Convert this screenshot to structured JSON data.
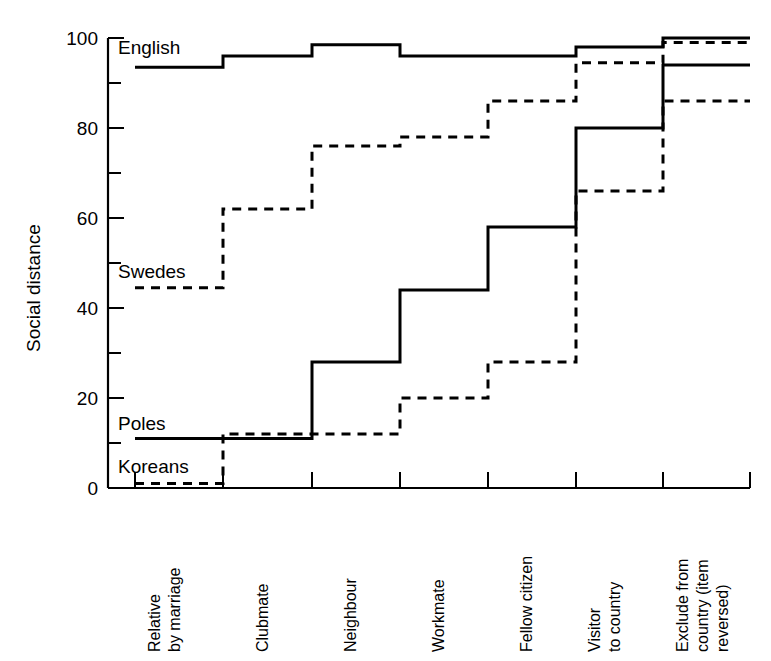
{
  "chart_data": {
    "type": "line",
    "title": "",
    "xlabel": "",
    "ylabel": "Social distance",
    "ylim": [
      0,
      100
    ],
    "yticks": [
      0,
      20,
      40,
      60,
      80,
      100
    ],
    "yticks_minor": [
      10,
      30,
      50,
      70,
      90
    ],
    "ytick_labels": [
      "0",
      "20",
      "40",
      "60",
      "80",
      "100"
    ],
    "grid": false,
    "legend_position": "inline-left",
    "step_style": "post",
    "categories": [
      "Relative by marriage",
      "Clubmate",
      "Neighbour",
      "Workmate",
      "Fellow citizen",
      "Visitor to country",
      "Exclude from country (item reversed)"
    ],
    "category_lines": [
      [
        "Relative",
        "by marriage"
      ],
      [
        "Clubmate"
      ],
      [
        "Neighbour"
      ],
      [
        "Workmate"
      ],
      [
        "Fellow citizen"
      ],
      [
        "Visitor",
        "to country"
      ],
      [
        "Exclude from",
        "country (item",
        "reversed)"
      ]
    ],
    "series": [
      {
        "name": "English",
        "style": "solid",
        "values": [
          93.5,
          96,
          98.5,
          96,
          96,
          98,
          100
        ]
      },
      {
        "name": "Swedes",
        "style": "dashed",
        "values": [
          44.5,
          62,
          76,
          78,
          86,
          94.5,
          99
        ]
      },
      {
        "name": "Poles",
        "style": "solid",
        "values": [
          11,
          11,
          28,
          44,
          58,
          80,
          94
        ]
      },
      {
        "name": "Koreans",
        "style": "dashed",
        "values": [
          1,
          12,
          12,
          20,
          28,
          66,
          86
        ]
      }
    ]
  },
  "axes": {
    "y_axis_title": "Social distance"
  },
  "series_labels": {
    "english": "English",
    "swedes": "Swedes",
    "poles": "Poles",
    "koreans": "Koreans"
  },
  "ytick_text": {
    "t100": "100",
    "t80": "80",
    "t60": "60",
    "t40": "40",
    "t20": "20",
    "t0": "0"
  },
  "xcat_text": {
    "c0l0": "Relative",
    "c0l1": "by marriage",
    "c1l0": "Clubmate",
    "c2l0": "Neighbour",
    "c3l0": "Workmate",
    "c4l0": "Fellow citizen",
    "c5l0": "Visitor",
    "c5l1": "to country",
    "c6l0": "Exclude from",
    "c6l1": "country (item",
    "c6l2": "reversed)"
  },
  "colors": {
    "ink": "#000000",
    "background": "#ffffff"
  }
}
